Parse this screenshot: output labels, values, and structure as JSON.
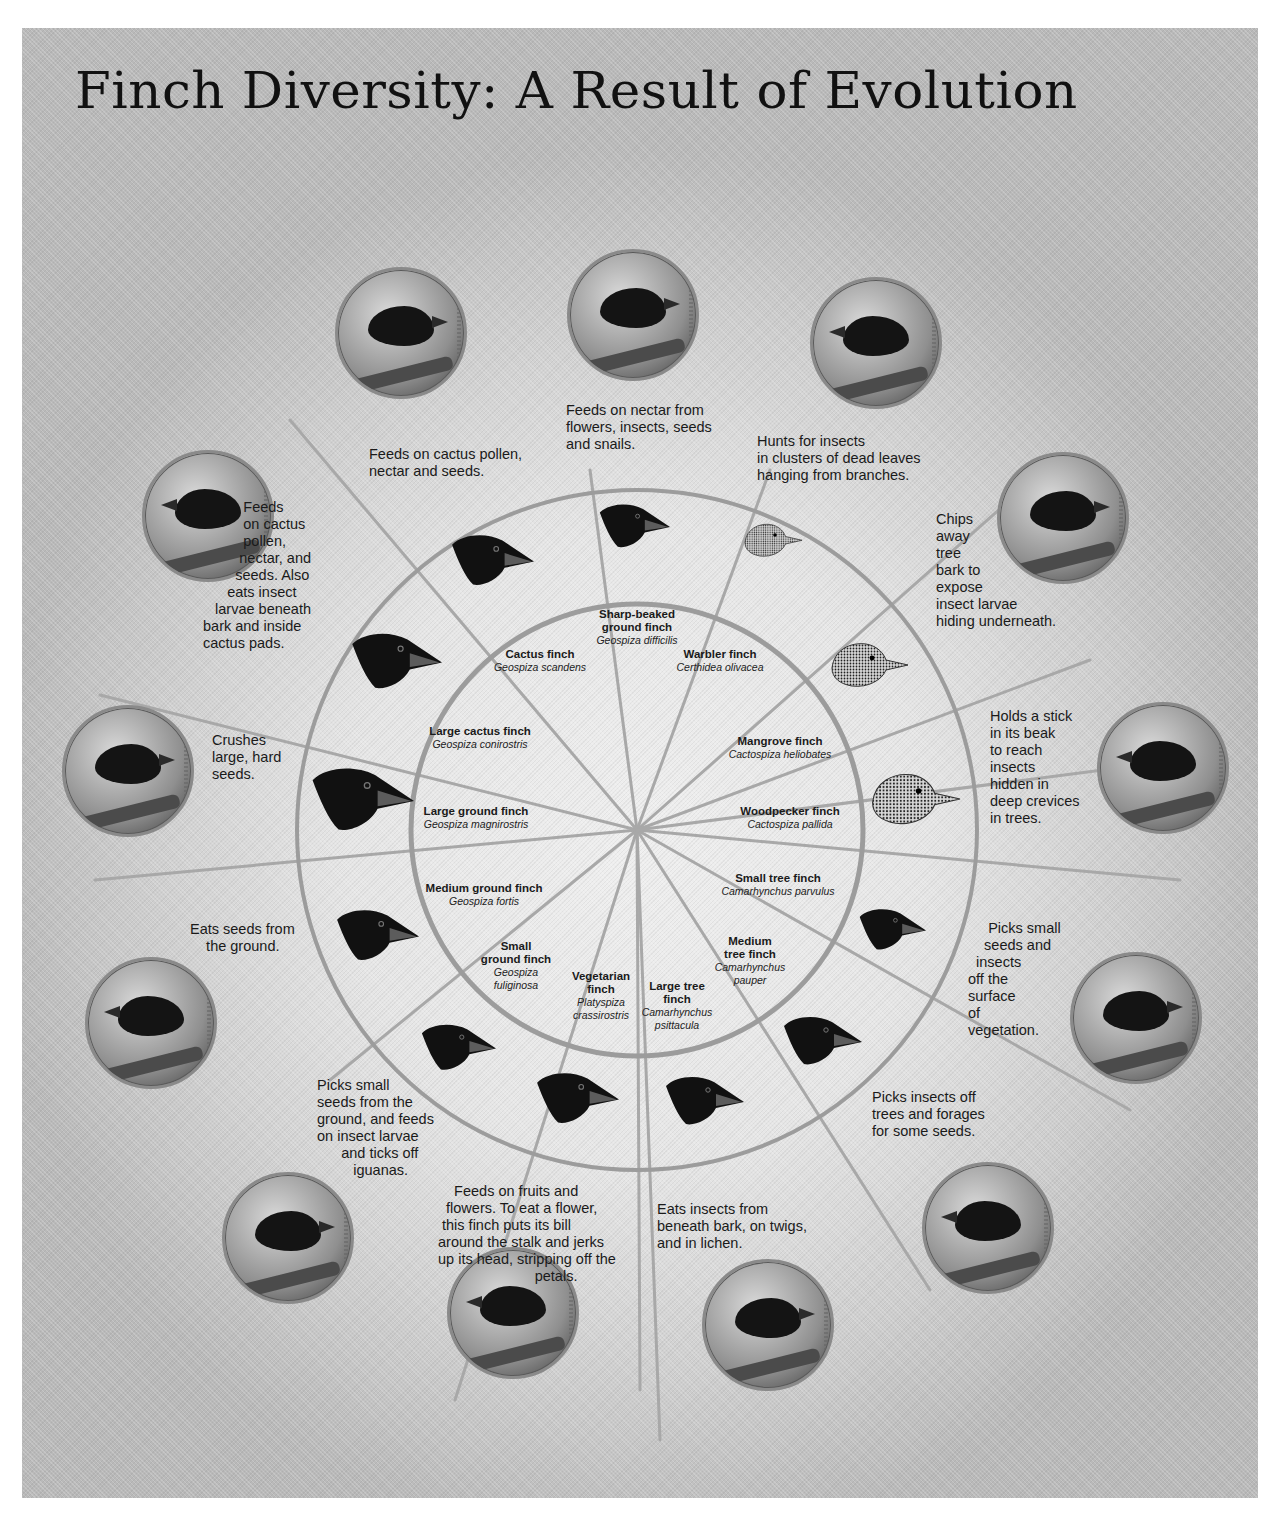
{
  "title": "Finch Diversity: A Result of Evolution",
  "colors": {
    "ring": "#9a9a9a",
    "spoke": "#a8a8a8",
    "beak_fill": "#111111",
    "text": "#1a1a1a"
  },
  "finches": [
    {
      "common": "Sharp-beaked ground finch",
      "common_lines": [
        "Sharp-beaked",
        "ground finch"
      ],
      "scientific": "Geospiza difficilis",
      "description": "Feeds on nectar from\nflowers, insects, seeds\nand snails.",
      "beak_icon": "beak-silhouette-icon"
    },
    {
      "common": "Warbler finch",
      "common_lines": [
        "Warbler finch"
      ],
      "scientific": "Certhidea olivacea",
      "description": "Hunts for insects\nin clusters of dead leaves\nhanging from branches.",
      "beak_icon": "beak-sketch-icon"
    },
    {
      "common": "Mangrove finch",
      "common_lines": [
        "Mangrove finch"
      ],
      "scientific": "Cactospiza heliobates",
      "description": "Chips\naway\ntree\nbark to\nexpose\ninsect larvae\nhiding underneath.",
      "beak_icon": "beak-sketch-icon"
    },
    {
      "common": "Woodpecker finch",
      "common_lines": [
        "Woodpecker finch"
      ],
      "scientific": "Cactospiza pallida",
      "description": "Holds a stick\nin its beak\nto reach\ninsects\nhidden in\ndeep crevices\nin trees.",
      "beak_icon": "beak-sketch-icon"
    },
    {
      "common": "Small tree finch",
      "common_lines": [
        "Small tree finch"
      ],
      "scientific": "Camarhynchus parvulus",
      "description": "     Picks small\n    seeds and\n  insects\noff the\nsurface\nof\nvegetation.",
      "beak_icon": "beak-silhouette-icon"
    },
    {
      "common": "Medium tree finch",
      "common_lines": [
        "Medium",
        "tree finch"
      ],
      "scientific": "Camarhynchus pauper",
      "scientific_lines": [
        "Camarhynchus",
        "pauper"
      ],
      "description": "Picks insects off\ntrees and forages\nfor some seeds.",
      "beak_icon": "beak-silhouette-icon"
    },
    {
      "common": "Large tree finch",
      "common_lines": [
        "Large tree",
        "finch"
      ],
      "scientific": "Camarhynchus psittacula",
      "scientific_lines": [
        "Camarhynchus",
        "psittacula"
      ],
      "description": "Eats insects from\nbeneath bark, on twigs,\nand in lichen.",
      "beak_icon": "beak-silhouette-icon"
    },
    {
      "common": "Vegetarian finch",
      "common_lines": [
        "Vegetarian",
        "finch"
      ],
      "scientific": "Platyspiza crassirostris",
      "scientific_lines": [
        "Platyspiza",
        "crassirostris"
      ],
      "description": "    Feeds on fruits and\n  flowers. To eat a flower,\n this finch puts its bill\naround the stalk and jerks\nup its head, stripping off the\n                        petals.",
      "beak_icon": "beak-silhouette-icon"
    },
    {
      "common": "Small ground finch",
      "common_lines": [
        "Small",
        "ground finch"
      ],
      "scientific": "Geospiza fuliginosa",
      "scientific_lines": [
        "Geospiza",
        "fuliginosa"
      ],
      "description": "Picks small\nseeds from the\nground, and feeds\non insect larvae\n      and ticks off\n         iguanas.",
      "beak_icon": "beak-silhouette-icon"
    },
    {
      "common": "Medium ground finch",
      "common_lines": [
        "Medium ground finch"
      ],
      "scientific": "Geospiza fortis",
      "description": "Eats seeds from\n    the ground.",
      "beak_icon": "beak-silhouette-icon"
    },
    {
      "common": "Large ground finch",
      "common_lines": [
        "Large ground finch"
      ],
      "scientific": "Geospiza magnirostris",
      "description": "Crushes\nlarge, hard\nseeds.",
      "beak_icon": "beak-silhouette-icon"
    },
    {
      "common": "Large cactus finch",
      "common_lines": [
        "Large cactus finch"
      ],
      "scientific": "Geospiza conirostris",
      "description": "          Feeds\n          on cactus\n          pollen,\n         nectar, and\n        seeds. Also\n      eats insect\n   larvae beneath\nbark and inside\ncactus pads.",
      "beak_icon": "beak-silhouette-icon"
    },
    {
      "common": "Cactus finch",
      "common_lines": [
        "Cactus finch"
      ],
      "scientific": "Geospiza scandens",
      "description": "Feeds on cactus pollen,\nnectar and seeds.",
      "beak_icon": "beak-silhouette-icon"
    }
  ]
}
